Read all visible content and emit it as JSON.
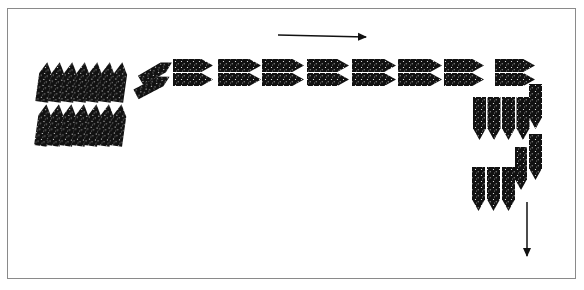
{
  "diagram": {
    "colors": {
      "unit": "#111111",
      "arrow": "#111111",
      "frame": "#8a8a8a",
      "background": "#ffffff"
    },
    "arrows": [
      {
        "name": "arrow-right",
        "x1": 278,
        "y1": 35,
        "x2": 366,
        "y2": 37
      },
      {
        "name": "arrow-down",
        "x1": 527,
        "y1": 202,
        "x2": 527,
        "y2": 256
      }
    ],
    "groups": {
      "left_block_top": {
        "count": 7,
        "direction": "up",
        "x": 38,
        "y": 62,
        "w": 13,
        "h": 40,
        "dx": 12.5
      },
      "left_block_bottom": {
        "count": 7,
        "direction": "up",
        "x": 37,
        "y": 104,
        "w": 13,
        "h": 42,
        "dx": 12.5
      },
      "diagonal_pair": {
        "count": 2
      },
      "horizontal_top_row": {
        "count": 8,
        "direction": "right",
        "y": 60
      },
      "horizontal_bottom_row": {
        "count": 8,
        "direction": "right",
        "y": 74
      },
      "right_column_upper": {
        "count": 4,
        "direction": "down",
        "x": 474,
        "y": 97
      },
      "right_column_lower": {
        "count": 3,
        "direction": "down",
        "x": 472,
        "y": 167
      },
      "side_column": {
        "count": 3,
        "direction": "down"
      }
    }
  }
}
